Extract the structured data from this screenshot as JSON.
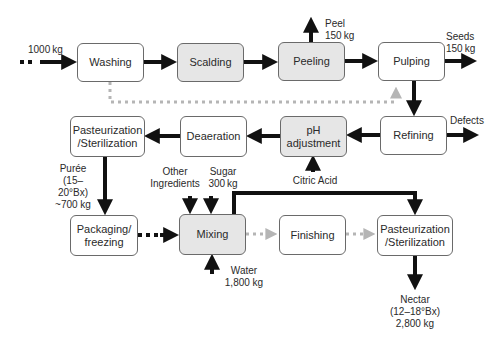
{
  "diagram": {
    "title": "",
    "steps": [
      {
        "id": "washing",
        "label": "Washing",
        "shaded": false
      },
      {
        "id": "scalding",
        "label": "Scalding",
        "shaded": true
      },
      {
        "id": "peeling",
        "label": "Peeling",
        "shaded": true
      },
      {
        "id": "pulping",
        "label": "Pulping",
        "shaded": false
      },
      {
        "id": "refining",
        "label": "Refining",
        "shaded": false
      },
      {
        "id": "ph_adjustment",
        "label": "pH\nadjustment",
        "shaded": true
      },
      {
        "id": "deaeration",
        "label": "Deaeration",
        "shaded": false
      },
      {
        "id": "pasteurization_puree",
        "label": "Pasteurization\n/Sterilization",
        "shaded": false
      },
      {
        "id": "packaging",
        "label": "Packaging/\nfreezing",
        "shaded": false
      },
      {
        "id": "mixing",
        "label": "Mixing",
        "shaded": true
      },
      {
        "id": "finishing",
        "label": "Finishing",
        "shaded": false
      },
      {
        "id": "pasteurization_nectar",
        "label": "Pasteurization\n/Sterilization",
        "shaded": false
      }
    ],
    "annotations": {
      "input": "1000 kg",
      "peel": "Peel\n150 kg",
      "seeds": "Seeds\n150 kg",
      "defects": "Defects",
      "citric_acid": "Citric Acid",
      "puree": "Purée\n(15–20°Bx)\n~700 kg",
      "other_ingredients": "Other\nIngredients",
      "sugar": "Sugar\n300 kg",
      "water": "Water\n1,800 kg",
      "nectar": "Nectar\n(12–18°Bx)\n2,800 kg"
    },
    "colors": {
      "box_border": "#6a6a6a",
      "shaded_fill": "#e6e6e6",
      "arrow": "#111111",
      "dotted_grey": "#b5b5b5"
    }
  }
}
